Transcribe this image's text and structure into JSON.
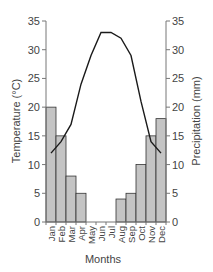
{
  "chart_data": {
    "type": "bar+line",
    "title": "",
    "categories": [
      "Jan",
      "Feb",
      "Mar",
      "Apr",
      "May",
      "Jun",
      "Jul",
      "Aug",
      "Sep",
      "Oct",
      "Nov",
      "Dec"
    ],
    "series": [
      {
        "name": "Precipitation",
        "type": "bar",
        "axis": "right",
        "color": "#c4c4c4",
        "values": [
          20,
          15,
          8,
          5,
          0,
          0,
          0,
          4,
          5,
          10,
          15,
          18
        ]
      },
      {
        "name": "Temperature",
        "type": "line",
        "axis": "left",
        "color": "#1a1a1a",
        "values": [
          12,
          14,
          17,
          24,
          29,
          33,
          33,
          32,
          29,
          21,
          14,
          12
        ]
      }
    ],
    "xlabel": "Months",
    "ylabel": "Temperature (°C)",
    "y2label": "Precipitation (mm)",
    "ylim": [
      0,
      35
    ],
    "y2lim": [
      0,
      35
    ],
    "yticks": [
      0,
      5,
      10,
      15,
      20,
      25,
      30,
      35
    ],
    "grid": false,
    "legend": "none"
  }
}
